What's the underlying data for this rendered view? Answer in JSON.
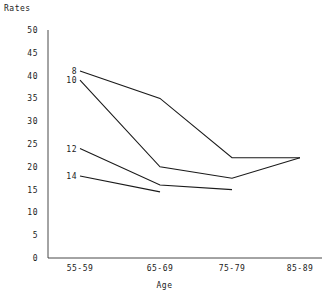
{
  "chart_data": {
    "type": "line",
    "title": "",
    "xlabel": "Age",
    "ylabel": "Rates",
    "categories": [
      "55-59",
      "65-69",
      "75-79",
      "85-89"
    ],
    "ylim": [
      0,
      50
    ],
    "ytick_labels": [
      "0",
      "5",
      "10",
      "15",
      "20",
      "25",
      "30",
      "35",
      "40",
      "45",
      "50"
    ],
    "ytick_values": [
      0,
      5,
      10,
      15,
      20,
      25,
      30,
      35,
      40,
      45,
      50
    ],
    "grid": false,
    "legend": "inline-labels-at-left-end-of-each-line",
    "series": [
      {
        "name": "8",
        "label": "8",
        "x": [
          "55-59",
          "65-69",
          "75-79",
          "85-89"
        ],
        "values": [
          41,
          35,
          22,
          22
        ]
      },
      {
        "name": "10",
        "label": "10",
        "x": [
          "55-59",
          "65-69",
          "75-79",
          "85-89"
        ],
        "values": [
          39,
          20,
          17.5,
          22
        ]
      },
      {
        "name": "12",
        "label": "12",
        "x": [
          "55-59",
          "65-69",
          "75-79"
        ],
        "values": [
          24,
          16,
          15
        ]
      },
      {
        "name": "14",
        "label": "14",
        "x": [
          "55-59",
          "65-69"
        ],
        "values": [
          18,
          14.5
        ]
      }
    ]
  }
}
